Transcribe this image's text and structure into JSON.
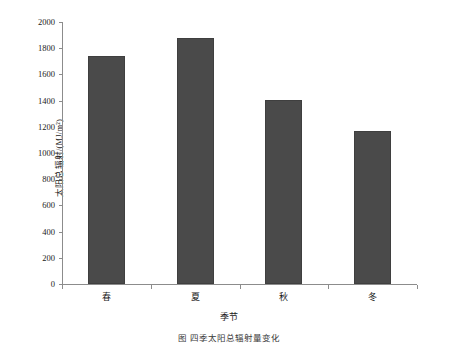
{
  "chart_data": {
    "type": "bar",
    "title": "",
    "categories": [
      "春",
      "夏",
      "秋",
      "冬"
    ],
    "values": [
      1740,
      1880,
      1405,
      1170
    ],
    "xlabel": "季节",
    "ylabel": "太阳总辐射/(MJ/m²)",
    "ylim": [
      0,
      2000
    ],
    "ytick_labels": [
      "2000",
      "1800",
      "1600",
      "1400",
      "1200",
      "1000",
      "800",
      "600",
      "400",
      "200",
      "0"
    ],
    "ytick_values": [
      2000,
      1800,
      1600,
      1400,
      1200,
      1000,
      800,
      600,
      400,
      200,
      0
    ],
    "grid": false,
    "legend": null,
    "bar_color": "#4a4a4a",
    "axis_color": "#8c8c8c"
  },
  "caption": {
    "text": "图     四季太阳总辐射量变化"
  }
}
